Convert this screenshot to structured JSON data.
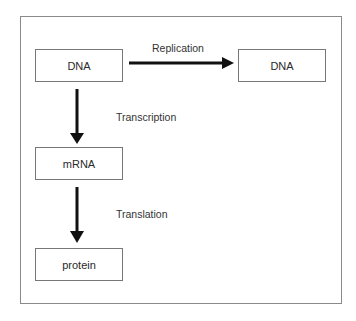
{
  "diagram": {
    "nodes": [
      {
        "id": "dna_source",
        "label": "DNA"
      },
      {
        "id": "dna_copy",
        "label": "DNA"
      },
      {
        "id": "mrna",
        "label": "mRNA"
      },
      {
        "id": "protein",
        "label": "protein"
      }
    ],
    "edges": [
      {
        "from": "dna_source",
        "to": "dna_copy",
        "label": "Replication"
      },
      {
        "from": "dna_source",
        "to": "mrna",
        "label": "Transcription"
      },
      {
        "from": "mrna",
        "to": "protein",
        "label": "Translation"
      }
    ],
    "colors": {
      "arrow": "#111111",
      "border": "#777777",
      "frame": "#8a8a8a"
    }
  }
}
